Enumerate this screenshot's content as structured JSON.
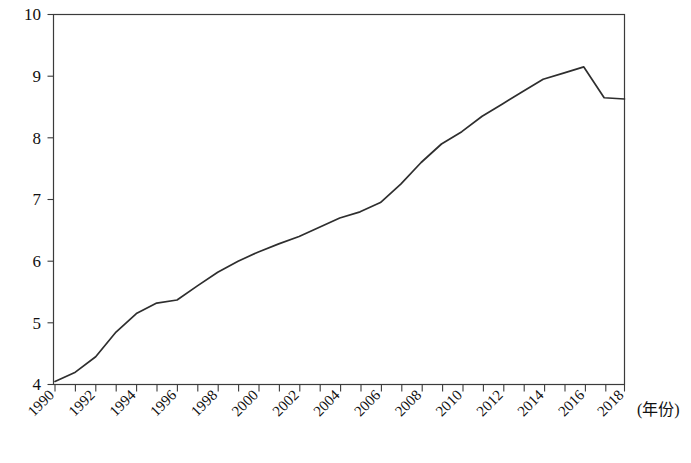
{
  "chart_data": {
    "type": "line",
    "title": "",
    "xlabel": "(年份)",
    "ylabel": "",
    "xlim": [
      1990,
      2018
    ],
    "ylim": [
      4,
      10
    ],
    "grid": false,
    "legend": null,
    "line_color": "#2e2e2e",
    "x": [
      1990,
      1991,
      1992,
      1993,
      1994,
      1995,
      1996,
      1997,
      1998,
      1999,
      2000,
      2001,
      2002,
      2003,
      2004,
      2005,
      2006,
      2007,
      2008,
      2009,
      2010,
      2011,
      2012,
      2013,
      2014,
      2015,
      2016,
      2017,
      2018
    ],
    "values": [
      4.05,
      4.2,
      4.45,
      4.85,
      5.15,
      5.32,
      5.37,
      5.6,
      5.82,
      6.0,
      6.15,
      6.28,
      6.4,
      6.55,
      6.7,
      6.8,
      6.95,
      7.25,
      7.6,
      7.9,
      8.1,
      8.35,
      8.55,
      8.75,
      8.95,
      9.05,
      9.15,
      8.65,
      8.63
    ],
    "y_ticks": [
      4,
      5,
      6,
      7,
      8,
      9,
      10
    ],
    "y_tick_labels": [
      "4",
      "5",
      "6",
      "7",
      "8",
      "9",
      "10"
    ],
    "x_ticks": [
      1990,
      1991,
      1992,
      1993,
      1994,
      1995,
      1996,
      1997,
      1998,
      1999,
      2000,
      2001,
      2002,
      2003,
      2004,
      2005,
      2006,
      2007,
      2008,
      2009,
      2010,
      2011,
      2012,
      2013,
      2014,
      2015,
      2016,
      2017,
      2018
    ],
    "x_tick_labels": [
      "1990",
      "1992",
      "1994",
      "1996",
      "1998",
      "2000",
      "2002",
      "2004",
      "2006",
      "2008",
      "2010",
      "2012",
      "2014",
      "2016",
      "2018"
    ],
    "x_tick_label_years": [
      1990,
      1992,
      1994,
      1996,
      1998,
      2000,
      2002,
      2004,
      2006,
      2008,
      2010,
      2012,
      2014,
      2016,
      2018
    ],
    "x_label_rotation": -45
  },
  "axis": {
    "x_title": "(年份)",
    "y_title": ""
  },
  "yticks": {
    "t0": "4",
    "t1": "5",
    "t2": "6",
    "t3": "7",
    "t4": "8",
    "t5": "9",
    "t6": "10"
  },
  "xticks": {
    "t0": "1990",
    "t1": "1992",
    "t2": "1994",
    "t3": "1996",
    "t4": "1998",
    "t5": "2000",
    "t6": "2002",
    "t7": "2004",
    "t8": "2006",
    "t9": "2008",
    "t10": "2010",
    "t11": "2012",
    "t12": "2014",
    "t13": "2016",
    "t14": "2018"
  }
}
